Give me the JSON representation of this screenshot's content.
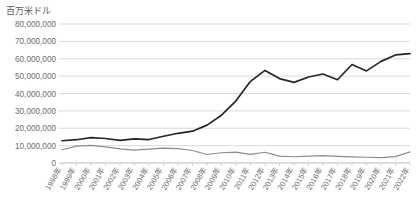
{
  "chart_data": {
    "type": "line",
    "title": "",
    "ylabel": "百万米ドル",
    "xlabel": "",
    "ylim": [
      0,
      80000000
    ],
    "yticks": [
      0,
      10000000,
      20000000,
      30000000,
      40000000,
      50000000,
      60000000,
      70000000,
      80000000
    ],
    "ytick_labels": [
      "0",
      "10,000,000",
      "20,000,000",
      "30,000,000",
      "40,000,000",
      "50,000,000",
      "60,000,000",
      "70,000,000",
      "80,000,000"
    ],
    "grid": true,
    "legend": "none",
    "categories": [
      "1998年",
      "1999年",
      "2000年",
      "2001年",
      "2002年",
      "2003年",
      "2004年",
      "2005年",
      "2006年",
      "2007年",
      "2008年",
      "2009年",
      "2010年",
      "2011年",
      "2012年",
      "2013年",
      "2014年",
      "2015年",
      "2016年",
      "2017年",
      "2018年",
      "2019年",
      "2020年",
      "2021年",
      "2022年"
    ],
    "series": [
      {
        "name": "series-1",
        "color": "#262626",
        "width": 1.7,
        "values": [
          12800000,
          13400000,
          14600000,
          14100000,
          13000000,
          13900000,
          13500000,
          15400000,
          17100000,
          18300000,
          21800000,
          27500000,
          35800000,
          47000000,
          53300000,
          48600000,
          46400000,
          49500000,
          51200000,
          47900000,
          56700000,
          53000000,
          58500000,
          62200000,
          63000000
        ]
      },
      {
        "name": "series-2",
        "color": "#8c8c8c",
        "width": 1.2,
        "values": [
          7600000,
          9700000,
          10200000,
          9300000,
          8100000,
          7400000,
          8000000,
          8600000,
          8300000,
          7200000,
          4900000,
          5900000,
          6300000,
          5000000,
          6200000,
          4000000,
          3600000,
          3900000,
          4200000,
          3800000,
          3500000,
          3300000,
          3100000,
          3700000,
          6400000
        ]
      }
    ]
  },
  "plot_geometry": {
    "left": 62,
    "right": 410,
    "top": 24,
    "bottom": 163
  }
}
